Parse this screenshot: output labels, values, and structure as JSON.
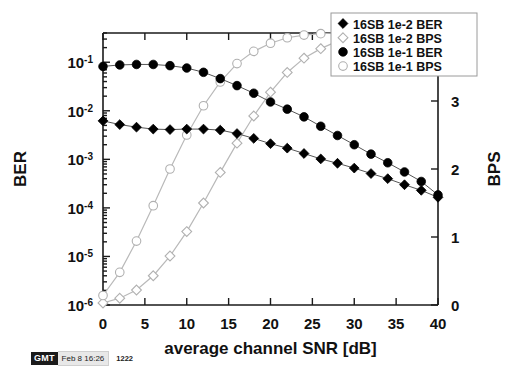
{
  "stamp": {
    "badge": "GMT",
    "date": "Feb 8 16:26",
    "number": "1222"
  },
  "chart_data": {
    "type": "line",
    "title": "",
    "xlabel": "average channel SNR [dB]",
    "ylabel": "BER",
    "y2label": "BPS",
    "xlim": [
      0,
      40
    ],
    "xticks": [
      0,
      5,
      10,
      15,
      20,
      25,
      30,
      35,
      40
    ],
    "xticklabels": [
      "0",
      "5",
      "10",
      "15",
      "20",
      "25",
      "30",
      "35",
      "40"
    ],
    "yscale": "log",
    "ylim": [
      1e-06,
      0.4
    ],
    "yticks": [
      0.1,
      0.01,
      0.001,
      0.0001,
      1e-05,
      1e-06
    ],
    "yticklabels": [
      "10-1",
      "10-2",
      "10-3",
      "10-4",
      "10-5",
      "10-6"
    ],
    "ytick_mantissa": [
      "10",
      "10",
      "10",
      "10",
      "10",
      "10"
    ],
    "ytick_exponent": [
      "-1",
      "-2",
      "-3",
      "-4",
      "-5",
      "-6"
    ],
    "y2lim": [
      0,
      4
    ],
    "y2ticks": [
      0,
      1,
      2,
      3,
      4
    ],
    "y2ticklabels": [
      "0",
      "1",
      "2",
      "3",
      "4"
    ],
    "grid": false,
    "legend_position": "top-right",
    "series": [
      {
        "name": "16SB 1e-2 BER",
        "axis": "left",
        "marker": "filled-diamond",
        "color": "#000000",
        "x": [
          0,
          2,
          4,
          6,
          8,
          10,
          12,
          14,
          16,
          18,
          20,
          22,
          24,
          26,
          28,
          30,
          32,
          34,
          36,
          38,
          40
        ],
        "y": [
          0.0062,
          0.0052,
          0.0046,
          0.0042,
          0.0041,
          0.0042,
          0.0042,
          0.004,
          0.0034,
          0.0027,
          0.0021,
          0.0017,
          0.00132,
          0.00102,
          0.00083,
          0.00066,
          0.00051,
          0.0004,
          0.0003,
          0.00023,
          0.000165
        ]
      },
      {
        "name": "16SB 1e-2 BPS",
        "axis": "right",
        "marker": "open-diamond",
        "color": "#c8c8c8",
        "x": [
          0,
          2,
          4,
          6,
          8,
          10,
          12,
          14,
          16,
          18,
          20,
          22,
          24,
          26,
          28,
          30
        ],
        "y": [
          0.03,
          0.1,
          0.22,
          0.43,
          0.72,
          1.08,
          1.5,
          1.95,
          2.38,
          2.78,
          3.13,
          3.42,
          3.63,
          3.77,
          3.88,
          3.96
        ]
      },
      {
        "name": "16SB 1e-1 BER",
        "axis": "left",
        "marker": "filled-circle",
        "color": "#000000",
        "x": [
          0,
          2,
          4,
          6,
          8,
          10,
          12,
          14,
          16,
          18,
          20,
          22,
          24,
          26,
          28,
          30,
          32,
          34,
          36,
          38,
          40
        ],
        "y": [
          0.082,
          0.088,
          0.09,
          0.09,
          0.085,
          0.076,
          0.062,
          0.046,
          0.033,
          0.023,
          0.0152,
          0.0108,
          0.0075,
          0.0048,
          0.0031,
          0.002,
          0.00128,
          0.00085,
          0.00055,
          0.00035,
          0.000185
        ]
      },
      {
        "name": "16SB 1e-1 BPS",
        "axis": "right",
        "marker": "open-circle",
        "color": "#c8c8c8",
        "x": [
          0,
          2,
          4,
          6,
          8,
          10,
          12,
          14,
          16,
          18,
          20,
          22,
          24,
          26,
          28,
          30
        ],
        "y": [
          0.14,
          0.48,
          0.94,
          1.46,
          2.0,
          2.5,
          2.93,
          3.28,
          3.55,
          3.73,
          3.85,
          3.93,
          3.97,
          3.99,
          4.0,
          4.0
        ]
      }
    ]
  }
}
